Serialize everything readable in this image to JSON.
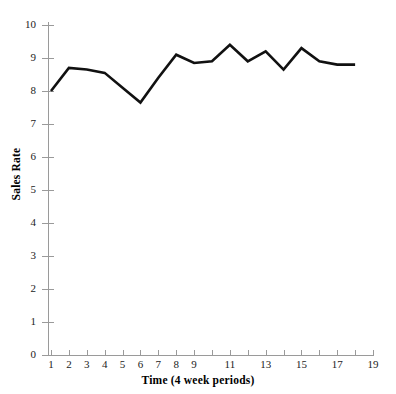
{
  "chart_data": {
    "type": "line",
    "title": "",
    "xlabel": "Time (4 week periods)",
    "ylabel": "Sales Rate",
    "xlim": [
      1,
      19
    ],
    "ylim": [
      0,
      10
    ],
    "grid": false,
    "legend": null,
    "x": [
      1,
      2,
      3,
      4,
      5,
      6,
      7,
      8,
      9,
      10,
      11,
      12,
      13,
      14,
      15,
      16,
      17,
      18
    ],
    "values": [
      8.0,
      8.7,
      8.65,
      8.55,
      8.1,
      7.65,
      8.4,
      9.1,
      8.85,
      8.9,
      9.4,
      8.9,
      9.2,
      8.65,
      9.3,
      8.9,
      8.8,
      8.8
    ],
    "series": [
      {
        "name": "Sales Rate",
        "color": "#111111",
        "values": [
          8.0,
          8.7,
          8.65,
          8.55,
          8.1,
          7.65,
          8.4,
          9.1,
          8.85,
          8.9,
          9.4,
          8.9,
          9.2,
          8.65,
          9.3,
          8.9,
          8.8,
          8.8
        ]
      }
    ],
    "y_ticks": [
      {
        "value": 0,
        "label": "0"
      },
      {
        "value": 1,
        "label": "1"
      },
      {
        "value": 2,
        "label": "2"
      },
      {
        "value": 3,
        "label": "3"
      },
      {
        "value": 4,
        "label": "4"
      },
      {
        "value": 5,
        "label": "5"
      },
      {
        "value": 6,
        "label": "6"
      },
      {
        "value": 7,
        "label": "7"
      },
      {
        "value": 8,
        "label": "8"
      },
      {
        "value": 9,
        "label": "9"
      },
      {
        "value": 10,
        "label": "10"
      }
    ],
    "x_ticks": [
      {
        "value": 1,
        "label": "1"
      },
      {
        "value": 2,
        "label": "2"
      },
      {
        "value": 3,
        "label": "3"
      },
      {
        "value": 4,
        "label": "4"
      },
      {
        "value": 5,
        "label": "5"
      },
      {
        "value": 6,
        "label": "6"
      },
      {
        "value": 7,
        "label": "7"
      },
      {
        "value": 8,
        "label": "8"
      },
      {
        "value": 9,
        "label": "9"
      },
      {
        "value": 10,
        "label": ""
      },
      {
        "value": 11,
        "label": "11"
      },
      {
        "value": 12,
        "label": ""
      },
      {
        "value": 13,
        "label": "13"
      },
      {
        "value": 14,
        "label": ""
      },
      {
        "value": 15,
        "label": "15"
      },
      {
        "value": 16,
        "label": ""
      },
      {
        "value": 17,
        "label": "17"
      },
      {
        "value": 18,
        "label": ""
      },
      {
        "value": 19,
        "label": "19"
      }
    ],
    "axis_color": "#9a9a9a",
    "line_color": "#111111",
    "background": "#ffffff"
  }
}
